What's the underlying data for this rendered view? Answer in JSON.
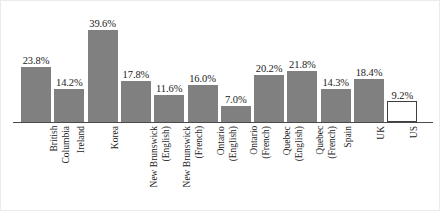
{
  "chart_data": {
    "type": "bar",
    "title": "",
    "subtitle": "",
    "xlabel": "",
    "ylabel": "",
    "ylim": [
      0,
      42
    ],
    "grid": false,
    "legend": null,
    "value_label_format": "percent-one-decimal",
    "categories": [
      "British Columbia",
      "Ireland",
      "Korea",
      "New Brunswick (English)",
      "New Brunswick (French)",
      "Ontario (English)",
      "Ontario (French)",
      "Quebec (English)",
      "Quebec (French)",
      "Spain",
      "UK",
      "US"
    ],
    "category_lines": [
      [
        "British",
        "Columbia"
      ],
      [
        "Ireland"
      ],
      [
        "Korea"
      ],
      [
        "New Brunswick",
        "(English)"
      ],
      [
        "New Brunswick",
        "(French)"
      ],
      [
        "Ontario",
        "(English)"
      ],
      [
        "Ontario",
        "(French)"
      ],
      [
        "Quebec",
        "(English)"
      ],
      [
        "Quebec",
        "(French)"
      ],
      [
        "Spain"
      ],
      [
        "UK"
      ],
      [
        "US"
      ]
    ],
    "values": [
      23.8,
      14.2,
      39.6,
      17.8,
      11.6,
      16.0,
      7.0,
      20.2,
      21.8,
      14.3,
      18.4,
      9.2
    ],
    "value_labels": [
      "23.8%",
      "14.2%",
      "39.6%",
      "17.8%",
      "11.6%",
      "16.0%",
      "7.0%",
      "20.2%",
      "21.8%",
      "14.3%",
      "18.4%",
      "9.2%"
    ],
    "bar_styles": [
      "filled",
      "filled",
      "filled",
      "filled",
      "filled",
      "filled",
      "filled",
      "filled",
      "filled",
      "filled",
      "filled",
      "hollow"
    ],
    "colors": {
      "bar_fill": "#808080",
      "bar_hollow_fill": "#ffffff",
      "bar_hollow_stroke": "#3f3f3f",
      "axis": "#4a4a4a",
      "text": "#1c1c1c",
      "background": "#ffffff",
      "frame": "#eceaea"
    }
  }
}
